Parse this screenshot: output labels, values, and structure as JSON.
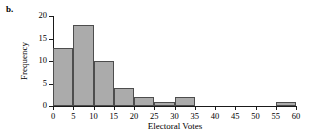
{
  "figure": {
    "panel_label": "b."
  },
  "chart_data": {
    "type": "bar",
    "title": "",
    "subtitle": "",
    "xlabel": "Electoral Votes",
    "ylabel": "Frequency",
    "xlim": [
      0,
      60
    ],
    "ylim": [
      0,
      20
    ],
    "bin_width": 5,
    "grid": false,
    "legend": null,
    "x_ticks": [
      0,
      5,
      10,
      15,
      20,
      25,
      30,
      35,
      40,
      45,
      50,
      55,
      60
    ],
    "y_ticks": [
      0,
      5,
      10,
      15,
      20
    ],
    "bin_edges": [
      0,
      5,
      10,
      15,
      20,
      25,
      30,
      35,
      40,
      45,
      50,
      55,
      60
    ],
    "categories": [
      "0-5",
      "5-10",
      "10-15",
      "15-20",
      "20-25",
      "25-30",
      "30-35",
      "35-40",
      "40-45",
      "45-50",
      "50-55",
      "55-60"
    ],
    "values": [
      13,
      18,
      10,
      4,
      2,
      1,
      2,
      0,
      0,
      0,
      0,
      1
    ],
    "bar_fill": "#ababab",
    "bar_edge": "#4d4d4d",
    "axis_color": "#1a1a1a"
  }
}
